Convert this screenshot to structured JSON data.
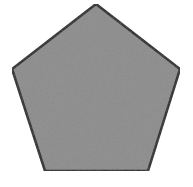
{
  "diagram": {
    "shape": "pentagon",
    "width": 193,
    "height": 187,
    "background": "#ffffff",
    "fill": "#8a8a8a",
    "stroke": "#141414",
    "stroke_width": 2.5,
    "points": "96,4 180,69 148,171 45,171 12,69"
  }
}
